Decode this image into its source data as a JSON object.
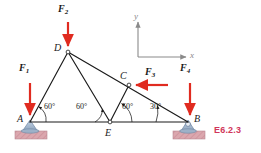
{
  "figure": {
    "id_label": "E6.2.3",
    "id_color": "#d1365a",
    "member_color": "#1a1a1a",
    "force_color": "#e02b20",
    "axis_color": "#8a8a8a",
    "support_color": "#9fb2cc",
    "ground_color": "#d9a0a8"
  },
  "nodes": [
    {
      "name": "A",
      "label": "A",
      "x": 30,
      "y": 122,
      "label_x": 17,
      "label_y": 116
    },
    {
      "name": "D",
      "label": "D",
      "x": 68,
      "y": 52,
      "label_x": 54,
      "label_y": 46
    },
    {
      "name": "E",
      "label": "E",
      "x": 110,
      "y": 122,
      "label_x": 105,
      "label_y": 128
    },
    {
      "name": "C",
      "label": "C",
      "x": 129,
      "y": 85,
      "label_x": 120,
      "label_y": 74
    },
    {
      "name": "B",
      "label": "B",
      "x": 188,
      "y": 122,
      "label_x": 194,
      "label_y": 116
    }
  ],
  "members": [
    {
      "name": "member-A-D",
      "from": "A",
      "to": "D"
    },
    {
      "name": "member-D-E",
      "from": "D",
      "to": "E"
    },
    {
      "name": "member-D-B",
      "from": "D",
      "to": "B"
    },
    {
      "name": "member-E-C",
      "from": "E",
      "to": "C"
    },
    {
      "name": "member-A-E",
      "from": "A",
      "to": "E"
    },
    {
      "name": "member-E-B",
      "from": "E",
      "to": "B"
    }
  ],
  "forces": [
    {
      "name": "force-F1",
      "label": "F",
      "subscript": "1",
      "direction": "down",
      "tail_x": 30,
      "tail_y": 83,
      "head_x": 30,
      "head_y": 118,
      "label_x": 19,
      "label_y": 66
    },
    {
      "name": "force-F2",
      "label": "F",
      "subscript": "2",
      "direction": "down",
      "tail_x": 68,
      "tail_y": 22,
      "head_x": 68,
      "head_y": 49,
      "label_x": 58,
      "label_y": 8
    },
    {
      "name": "force-F3",
      "label": "F",
      "subscript": "3",
      "direction": "left",
      "tail_x": 168,
      "tail_y": 85,
      "head_x": 133,
      "head_y": 85,
      "label_x": 145,
      "label_y": 70
    },
    {
      "name": "force-F4",
      "label": "F",
      "subscript": "4",
      "direction": "down",
      "tail_x": 190,
      "tail_y": 83,
      "head_x": 190,
      "head_y": 118,
      "label_x": 180,
      "label_y": 66
    }
  ],
  "angles": [
    {
      "name": "angle-at-A",
      "text": "60°",
      "label_x": 44,
      "label_y": 108,
      "arc_vertex": "A"
    },
    {
      "name": "angle-at-E-left",
      "text": "60°",
      "label_x": 76,
      "label_y": 108,
      "arc_vertex": "E"
    },
    {
      "name": "angle-at-E-right",
      "text": "60°",
      "label_x": 122,
      "label_y": 108,
      "arc_vertex": "E"
    },
    {
      "name": "angle-at-B",
      "text": "30°",
      "label_x": 150,
      "label_y": 108,
      "arc_vertex": "B"
    }
  ],
  "axes": {
    "origin_x": 138,
    "origin_y": 57,
    "y_tip_x": 138,
    "y_tip_y": 20,
    "x_tip_x": 188,
    "x_tip_y": 57,
    "y_label": "y",
    "x_label": "x",
    "y_label_x": 134,
    "y_label_y": 12,
    "x_label_x": 191,
    "x_label_y": 51
  },
  "supports": [
    {
      "name": "support-pin-A",
      "type": "pin",
      "x": 30,
      "y": 122
    },
    {
      "name": "support-roller-B",
      "type": "roller",
      "x": 188,
      "y": 122
    }
  ]
}
